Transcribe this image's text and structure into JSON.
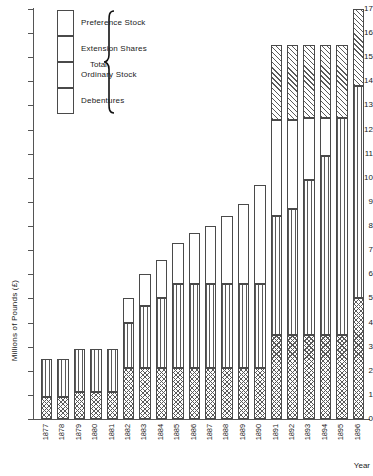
{
  "chart_data": {
    "type": "bar",
    "stacked": true,
    "title": "",
    "xlabel": "Year",
    "ylabel": "Millions of Pounds (£)",
    "ylim": [
      0,
      17
    ],
    "ytick_labels": [
      "0",
      "1",
      "2",
      "3",
      "4",
      "5",
      "6",
      "7",
      "8",
      "9",
      "10",
      "11",
      "12",
      "13",
      "14",
      "15",
      "16",
      "17"
    ],
    "grid": false,
    "legend_position": "top-left",
    "legend_group_label": "Total",
    "categories": [
      "1877",
      "1878",
      "1879",
      "1880",
      "1881",
      "1882",
      "1883",
      "1884",
      "1885",
      "1886",
      "1887",
      "1888",
      "1889",
      "1890",
      "1891",
      "1892",
      "1893",
      "1894",
      "1895",
      "1896"
    ],
    "series": [
      {
        "name": "Debentures",
        "values": [
          0.9,
          0.9,
          1.1,
          1.1,
          1.1,
          2.1,
          2.1,
          2.1,
          2.1,
          2.1,
          2.1,
          2.1,
          2.1,
          2.1,
          3.5,
          3.5,
          3.5,
          3.5,
          3.5,
          5.0
        ]
      },
      {
        "name": "Ordinary Stock",
        "values": [
          1.6,
          1.6,
          1.8,
          1.8,
          1.8,
          1.9,
          2.6,
          2.9,
          3.5,
          3.5,
          3.5,
          3.5,
          3.5,
          3.5,
          4.9,
          5.2,
          6.4,
          7.4,
          9.0,
          8.8
        ]
      },
      {
        "name": "Extension Shares",
        "values": [
          0.0,
          0.0,
          0.0,
          0.0,
          0.0,
          1.0,
          1.3,
          1.6,
          1.7,
          2.1,
          2.4,
          2.8,
          3.3,
          4.1,
          4.0,
          3.7,
          2.6,
          1.6,
          0.0,
          0.0
        ]
      },
      {
        "name": "Preference Stock",
        "values": [
          0.0,
          0.0,
          0.0,
          0.0,
          0.0,
          0.0,
          0.0,
          0.0,
          0.0,
          0.0,
          0.0,
          0.0,
          0.0,
          0.0,
          3.1,
          3.1,
          3.0,
          3.0,
          3.0,
          3.2
        ]
      }
    ],
    "totals": [
      2.5,
      2.5,
      2.9,
      2.9,
      2.9,
      5.0,
      6.0,
      6.6,
      7.3,
      7.7,
      8.0,
      8.4,
      8.9,
      9.7,
      15.5,
      15.5,
      15.5,
      15.5,
      15.5,
      17.0
    ]
  },
  "legend": {
    "group_label": "Total",
    "items": [
      {
        "label": "Preference Stock",
        "pattern": "diagonal-hatch"
      },
      {
        "label": "Extension Shares",
        "pattern": "dotted"
      },
      {
        "label": "Ordinary Stock",
        "pattern": "vertical-lines"
      },
      {
        "label": "Debentures",
        "pattern": "cross-hatch"
      }
    ]
  },
  "axes": {
    "y_title": "Millions of Pounds (£)",
    "x_title": "Year"
  }
}
